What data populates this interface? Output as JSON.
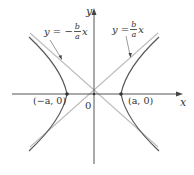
{
  "diagram": {
    "type": "hyperbola",
    "axes": {
      "x_label": "x",
      "y_label": "y",
      "origin_label": "0"
    },
    "vertices": [
      {
        "label": "(−a, 0)"
      },
      {
        "label": "(a, 0)"
      }
    ],
    "asymptotes": [
      {
        "lhs": "y = −",
        "num": "b",
        "den": "a",
        "var": "x"
      },
      {
        "lhs": "y =",
        "num": "b",
        "den": "a",
        "var": "x"
      }
    ],
    "colors": {
      "axis": "#555555",
      "curve": "#555555",
      "asymptote": "#b8b8b8",
      "text": "#333333"
    }
  }
}
